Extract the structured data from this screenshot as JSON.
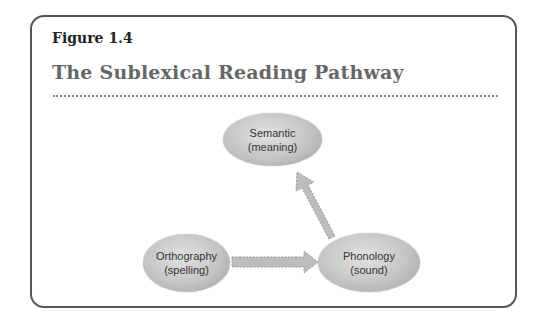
{
  "figure": {
    "label": "Figure 1.4",
    "title": "The Sublexical Reading Pathway"
  },
  "nodes": {
    "semantic": {
      "line1": "Semantic",
      "line2": "(meaning)"
    },
    "orthography": {
      "line1": "Orthography",
      "line2": "(spelling)"
    },
    "phonology": {
      "line1": "Phonology",
      "line2": "(sound)"
    }
  },
  "edges": [
    {
      "from": "orthography",
      "to": "phonology",
      "style": "dashed-arrow"
    },
    {
      "from": "phonology",
      "to": "semantic",
      "style": "dashed-arrow"
    }
  ],
  "colors": {
    "node_fill": "#c4c4c4",
    "arrow_fill": "#bdbdbd",
    "frame": "#555555",
    "title": "#666666"
  }
}
